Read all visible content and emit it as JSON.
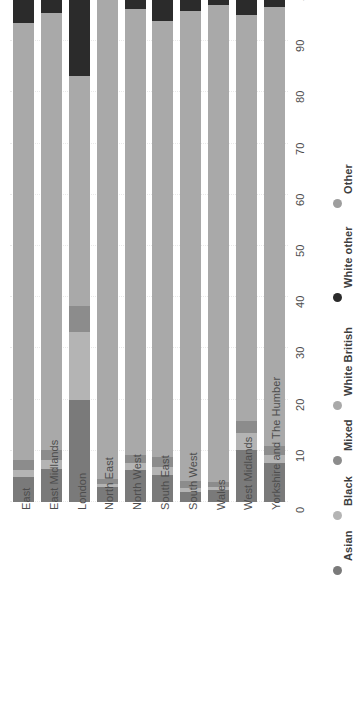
{
  "chart_data": {
    "type": "bar",
    "subtype": "stacked-horizontal-percent",
    "orientation": "rotated-90-ccw",
    "title": "",
    "xlabel": "",
    "ylabel": "",
    "xlim": [
      0,
      100
    ],
    "xticks": [
      0,
      10,
      20,
      30,
      40,
      50,
      60,
      70,
      80,
      90,
      100
    ],
    "tick_labels": [
      "0",
      "10",
      "20",
      "30",
      "40",
      "50",
      "60",
      "70",
      "80",
      "90",
      "100"
    ],
    "grid": true,
    "legend_position": "right",
    "categories": [
      "East",
      "East Midlands",
      "London",
      "North East",
      "North West",
      "South East",
      "South West",
      "Wales",
      "West Midlands",
      "Yorkshire and The Humber"
    ],
    "series": [
      {
        "name": "Asian",
        "color": "#7a7a7a",
        "values": [
          4.8,
          6.5,
          20.0,
          3.0,
          6.2,
          5.2,
          1.9,
          2.3,
          10.2,
          7.7
        ]
      },
      {
        "name": "Black",
        "color": "#b4b4b4",
        "values": [
          1.5,
          1.8,
          13.3,
          0.5,
          1.4,
          1.6,
          0.9,
          0.6,
          3.3,
          1.5
        ]
      },
      {
        "name": "Mixed",
        "color": "#8c8c8c",
        "values": [
          1.9,
          1.9,
          5.0,
          1.0,
          1.6,
          2.0,
          1.4,
          1.0,
          2.4,
          1.7
        ]
      },
      {
        "name": "White British",
        "color": "#a9a9a9",
        "values": [
          85.3,
          85.4,
          44.9,
          93.6,
          87.0,
          85.2,
          91.8,
          93.2,
          79.2,
          85.8
        ]
      },
      {
        "name": "White other",
        "color": "#2b2b2b",
        "values": [
          5.5,
          3.4,
          15.8,
          1.3,
          3.0,
          5.2,
          3.2,
          2.2,
          4.1,
          2.6
        ]
      },
      {
        "name": "Other",
        "color": "#9e9e9e",
        "values": [
          1.0,
          1.0,
          1.0,
          0.6,
          0.8,
          0.8,
          0.8,
          0.7,
          0.8,
          0.7
        ]
      }
    ],
    "legend_entries": [
      {
        "label": "Asian",
        "color": "#7a7a7a"
      },
      {
        "label": "Black",
        "color": "#b4b4b4"
      },
      {
        "label": "Mixed",
        "color": "#8c8c8c"
      },
      {
        "label": "White British",
        "color": "#a9a9a9"
      },
      {
        "label": "White other",
        "color": "#2b2b2b"
      },
      {
        "label": "Other",
        "color": "#9e9e9e"
      }
    ]
  }
}
